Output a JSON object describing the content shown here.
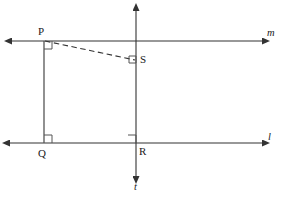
{
  "figure": {
    "background_color": "#ffffff",
    "stroke_color": "#333333",
    "label_color": "#1a1a1a"
  },
  "points": [
    {
      "id": "P",
      "label": "P",
      "x": 44,
      "y": 41
    },
    {
      "id": "Q",
      "label": "Q",
      "x": 44,
      "y": 143
    },
    {
      "id": "R",
      "label": "R",
      "x": 136,
      "y": 143
    },
    {
      "id": "S",
      "label": "S",
      "x": 136,
      "y": 60
    }
  ],
  "lines": [
    {
      "id": "m",
      "label": "m",
      "orientation": "horizontal",
      "y": 41,
      "x_start": 12,
      "x_end": 262,
      "arrows": "both",
      "style": "solid"
    },
    {
      "id": "l",
      "label": "l",
      "orientation": "horizontal",
      "y": 143,
      "x_start": 10,
      "x_end": 262,
      "arrows": "both",
      "style": "solid"
    },
    {
      "id": "t",
      "label": "t",
      "orientation": "vertical",
      "x": 136,
      "y_start": 11,
      "y_end": 176,
      "arrows": "both",
      "style": "solid"
    }
  ],
  "segments": [
    {
      "id": "PQ",
      "from": "P",
      "to": "Q",
      "style": "solid"
    },
    {
      "id": "PS",
      "from": "P",
      "to": "S",
      "style": "dashed"
    }
  ],
  "right_angles": [
    {
      "id": "angle-at-P",
      "at": "P",
      "description": "right angle between segment PQ and line m"
    },
    {
      "id": "angle-at-Q",
      "at": "Q",
      "description": "right angle between segment PQ and line l"
    },
    {
      "id": "angle-at-R",
      "at": "R",
      "description": "right angle between line t and line l"
    },
    {
      "id": "angle-at-S",
      "at": "S",
      "description": "right angle between dashed segment PS and line t"
    }
  ]
}
